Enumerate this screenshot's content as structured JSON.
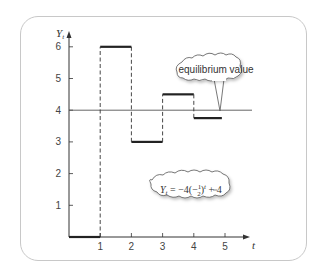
{
  "chart_data": {
    "type": "line",
    "subtype": "step",
    "title": "",
    "xlabel": "t",
    "ylabel": "Y_t",
    "xlim": [
      0,
      5.6
    ],
    "ylim": [
      0,
      6.5
    ],
    "x_ticks": [
      1,
      2,
      3,
      4,
      5
    ],
    "y_ticks": [
      1,
      2,
      3,
      4,
      5,
      6
    ],
    "grid": false,
    "series": [
      {
        "name": "Y_t",
        "steps": [
          {
            "t": 0,
            "value": 0
          },
          {
            "t": 1,
            "value": 6
          },
          {
            "t": 2,
            "value": 3
          },
          {
            "t": 3,
            "value": 4.5
          },
          {
            "t": 4,
            "value": 3.75
          }
        ]
      }
    ],
    "reference_lines": [
      {
        "axis": "y",
        "value": 4,
        "label": "equilibrium value"
      }
    ],
    "annotations": [
      {
        "text": "equilibrium value",
        "target": "equilibrium line"
      },
      {
        "text": "Y_t = −4(−1/2)^t + 4",
        "type": "equation"
      }
    ]
  },
  "labels": {
    "y_axis_main": "Y",
    "y_axis_sub": "t",
    "x_axis": "t",
    "callout": "equilibrium value",
    "equation_lhs": "Y",
    "equation_sub": "t",
    "equation_mid": " = −4(−",
    "equation_num": "1",
    "equation_den": "2",
    "equation_close": ")",
    "equation_exp": "t",
    "equation_tail": " + 4"
  }
}
